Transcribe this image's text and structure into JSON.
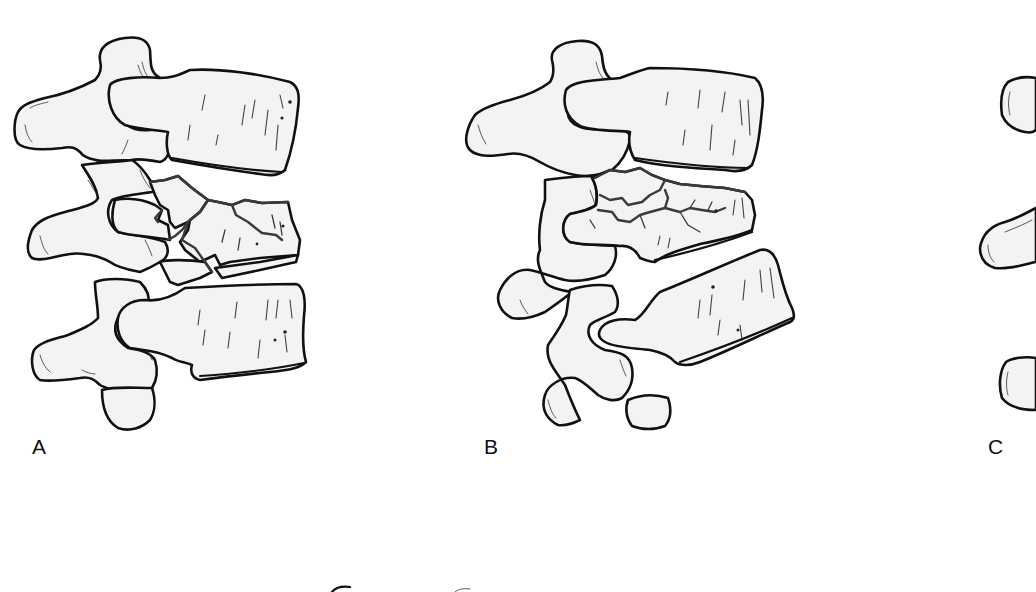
{
  "figure": {
    "panels": [
      {
        "id": "A",
        "label": "A",
        "content": "Three stacked vertebrae; middle vertebral body shows comminuted burst fracture with multiple fragments outlined in gray fracture lines"
      },
      {
        "id": "B",
        "label": "B",
        "content": "Three stacked vertebrae; middle vertebral body shows fragmented fracture with anterior wedging and branching fracture lines"
      },
      {
        "id": "C",
        "label": "C",
        "content": "Partially visible panel, cropped at right edge; three posterior processes visible"
      }
    ],
    "colors": {
      "background": "#ffffff",
      "bone_fill": "#f3f3f3",
      "outline": "#111111",
      "fracture_line": "#3a3a3a"
    }
  }
}
